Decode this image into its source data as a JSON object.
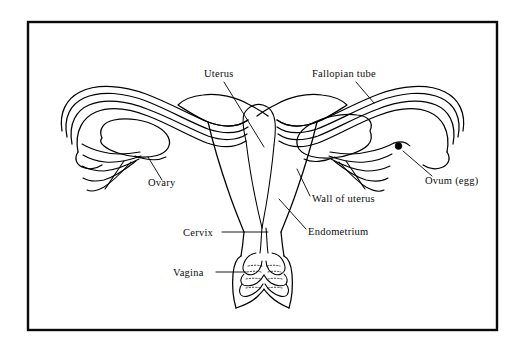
{
  "figure": {
    "background_color": "#ffffff",
    "line_color": "#000000",
    "frame": {
      "name": "diagram-border",
      "x": 28,
      "y": 22,
      "width": 469,
      "height": 308,
      "stroke_color": "#0a0a0a",
      "stroke_width": 2.4
    }
  },
  "labels": {
    "uterus": {
      "text": "Uterus",
      "x": 204,
      "y": 77,
      "anchor": "start"
    },
    "fallopian_tube": {
      "text": "Fallopian tube",
      "x": 312,
      "y": 77,
      "anchor": "start"
    },
    "ovary": {
      "text": "Ovary",
      "x": 148,
      "y": 186,
      "anchor": "start"
    },
    "ovum": {
      "text": "Ovum (egg)",
      "x": 425,
      "y": 184,
      "anchor": "start"
    },
    "wall_of_uterus": {
      "text": "Wall of uterus",
      "x": 312,
      "y": 202,
      "anchor": "start"
    },
    "endometrium": {
      "text": "Endometrium",
      "x": 308,
      "y": 235,
      "anchor": "start"
    },
    "cervix": {
      "text": "Cervix",
      "x": 183,
      "y": 236,
      "anchor": "start"
    },
    "vagina": {
      "text": "Vagina",
      "x": 173,
      "y": 276,
      "anchor": "start"
    }
  },
  "markers": {
    "ovum_dot": {
      "name": "ovum-egg-dot",
      "cx": 398.5,
      "cy": 146,
      "r": 3.4,
      "color": "#000000"
    }
  },
  "structures": [
    {
      "name": "left-fallopian-tube",
      "side": "left"
    },
    {
      "name": "right-fallopian-tube",
      "side": "right"
    },
    {
      "name": "left-ovary",
      "side": "left"
    },
    {
      "name": "right-ovary",
      "side": "right"
    },
    {
      "name": "left-fimbriae",
      "side": "left"
    },
    {
      "name": "right-fimbriae",
      "side": "right"
    },
    {
      "name": "uterus-body",
      "side": "center"
    },
    {
      "name": "endometrium-cavity",
      "side": "center"
    },
    {
      "name": "cervix-canal",
      "side": "center"
    },
    {
      "name": "vagina-canal",
      "side": "center"
    },
    {
      "name": "vaginal-rugae",
      "side": "center"
    }
  ]
}
